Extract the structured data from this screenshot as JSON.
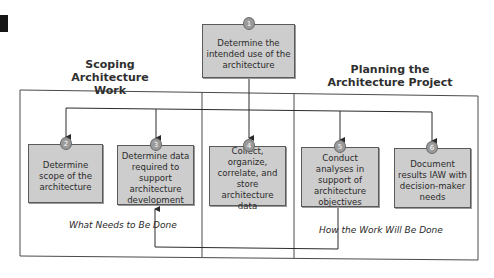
{
  "diagram": {
    "sections": {
      "left": {
        "title_line1": "Scoping",
        "title_line2": "Architecture Work"
      },
      "right": {
        "title_line1": "Planning the",
        "title_line2": "Architecture Project"
      }
    },
    "steps": [
      {
        "number": "1",
        "label": "Determine the intended use of the architecture"
      },
      {
        "number": "2",
        "label": "Determine scope of the architecture"
      },
      {
        "number": "3",
        "label": "Determine data required to support architecture development"
      },
      {
        "number": "4",
        "label": "Collect, organize, correlate, and store architecture data"
      },
      {
        "number": "5",
        "label": "Conduct analyses in support of architecture objectives"
      },
      {
        "number": "6",
        "label": "Document results IAW with decision-maker needs"
      }
    ],
    "annotations": {
      "what": "What Needs to Be Done",
      "how": "How the Work Will Be Done"
    },
    "colors": {
      "box_fill": "#cdcdcd",
      "badge_fill": "#9a9a9a",
      "line": "#3a3a3a"
    }
  }
}
